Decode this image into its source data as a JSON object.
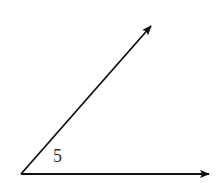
{
  "diagram": {
    "type": "angle",
    "stroke_color": "#111111",
    "label_color": "#333333",
    "vertex": {
      "x": 21,
      "y": 174
    },
    "rays": [
      {
        "name": "upper-ray",
        "tip": {
          "x": 151,
          "y": 26
        }
      },
      {
        "name": "horizontal-ray",
        "tip": {
          "x": 209,
          "y": 174
        }
      }
    ],
    "angle_label": {
      "text": "5",
      "x": 53,
      "y": 162
    }
  }
}
